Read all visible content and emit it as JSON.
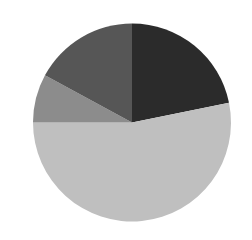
{
  "chart_data": {
    "type": "pie",
    "title": "",
    "start_angle_deg": 0,
    "direction": "clockwise",
    "labels": [
      "Slice A",
      "Slice B",
      "Slice C",
      "Slice D"
    ],
    "values": [
      21.8,
      53.2,
      7.9,
      17.1
    ],
    "colors": [
      "#2b2b2b",
      "#bfbfbf",
      "#8c8c8c",
      "#565656"
    ],
    "legend": "none"
  },
  "geometry": {
    "cx": 132,
    "cy": 122.5,
    "r": 99
  }
}
